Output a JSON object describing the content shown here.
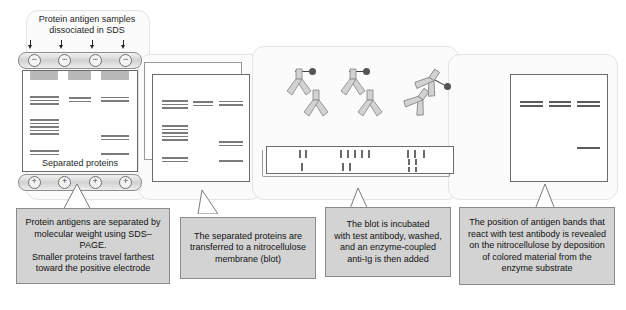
{
  "figure": {
    "background_color": "#ffffff",
    "caption_fill": "#d3d3d3",
    "caption_border": "#8b8b8b",
    "panel_fill": "#fbfbfb"
  },
  "panels": [
    {
      "id": "panel-1-sds-page",
      "top_label": "Protein antigen samples\ndissociated in SDS",
      "inner_label": "Separated proteins",
      "top_electrode_sign": "−",
      "bottom_electrode_sign": "+",
      "electrode_count": 4,
      "lane_count": 3,
      "caption": "Protein antigens are separated by\nmolecular weight using SDS–PAGE.\nSmaller proteins travel farthest\ntoward the positive electrode"
    },
    {
      "id": "panel-2-transfer",
      "caption": "The separated proteins are\ntransferred to a nitrocellulose\nmembrane (blot)"
    },
    {
      "id": "panel-3-incubation",
      "antibody_count": 6,
      "enzyme_label": "enzyme-coupled anti-Ig",
      "caption": "The blot is incubated\nwith test antibody, washed,\nand an enzyme-coupled\nanti-Ig is then added"
    },
    {
      "id": "panel-4-developed-blot",
      "caption": "The position of antigen bands that\nreact with test antibody is revealed\non the nitrocellulose by deposition\nof colored material from the\nenzyme substrate"
    }
  ],
  "gel_data": {
    "lanes": [
      {
        "lane": 1,
        "bands_y": [
          30,
          34,
          38,
          60,
          64,
          68,
          72,
          76,
          100,
          104
        ]
      },
      {
        "lane": 2,
        "bands_y": [
          32,
          36
        ]
      },
      {
        "lane": 3,
        "bands_y": [
          31,
          35,
          84,
          88,
          106
        ]
      }
    ]
  },
  "result_blot": {
    "lanes": [
      {
        "lane": 1,
        "bands_y": [
          30,
          35
        ]
      },
      {
        "lane": 2,
        "bands_y": [
          30,
          35
        ]
      },
      {
        "lane": 3,
        "bands_y": [
          30,
          35,
          78
        ]
      }
    ]
  }
}
